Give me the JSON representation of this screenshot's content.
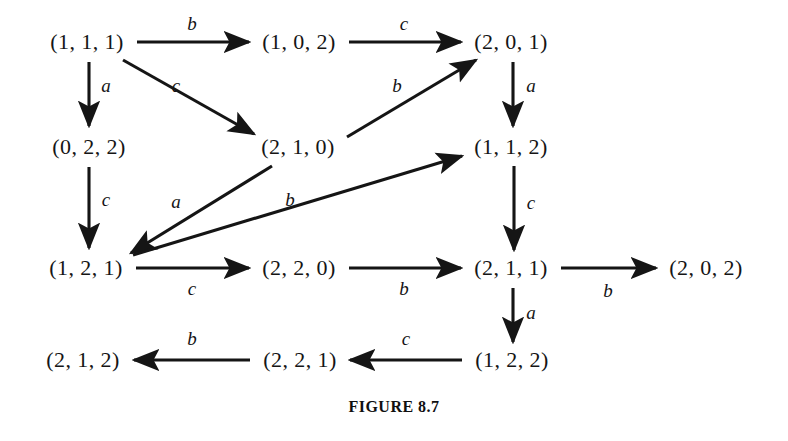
{
  "figure": {
    "caption": "FIGURE 8.7",
    "background_color": "#ffffff",
    "ink_color": "#151515",
    "width": 788,
    "height": 441
  },
  "graph_data": {
    "type": "directed-graph",
    "alphabet": [
      "a",
      "b",
      "c"
    ],
    "nodes": [
      {
        "id": "n111",
        "label": "(1, 1, 1)",
        "x": 87,
        "y": 42
      },
      {
        "id": "n102",
        "label": "(1, 0, 2)",
        "x": 299,
        "y": 42
      },
      {
        "id": "n201",
        "label": "(2, 0, 1)",
        "x": 511,
        "y": 42
      },
      {
        "id": "n022",
        "label": "(0, 2, 2)",
        "x": 89,
        "y": 147
      },
      {
        "id": "n210",
        "label": "(2, 1, 0)",
        "x": 298,
        "y": 147
      },
      {
        "id": "n112",
        "label": "(1, 1, 2)",
        "x": 511,
        "y": 147
      },
      {
        "id": "n121",
        "label": "(1, 2, 1)",
        "x": 86,
        "y": 268
      },
      {
        "id": "n220",
        "label": "(2, 2, 0)",
        "x": 299,
        "y": 268
      },
      {
        "id": "n211",
        "label": "(2, 1, 1)",
        "x": 511,
        "y": 268
      },
      {
        "id": "n202",
        "label": "(2, 0, 2)",
        "x": 706,
        "y": 268
      },
      {
        "id": "n212",
        "label": "(2, 1, 2)",
        "x": 83,
        "y": 360
      },
      {
        "id": "n221",
        "label": "(2, 2, 1)",
        "x": 300,
        "y": 360
      },
      {
        "id": "n122",
        "label": "(1, 2, 2)",
        "x": 512,
        "y": 360
      }
    ],
    "edges": [
      {
        "from": "n111",
        "to": "n102",
        "label": "b",
        "x1": 137,
        "y1": 42,
        "x2": 249,
        "y2": 42,
        "lx": 192,
        "ly": 24
      },
      {
        "from": "n102",
        "to": "n201",
        "label": "c",
        "x1": 349,
        "y1": 42,
        "x2": 461,
        "y2": 42,
        "lx": 404,
        "ly": 24
      },
      {
        "from": "n111",
        "to": "n022",
        "label": "a",
        "x1": 89,
        "y1": 62,
        "x2": 89,
        "y2": 126,
        "lx": 106,
        "ly": 86
      },
      {
        "from": "n111",
        "to": "n210",
        "label": "c",
        "x1": 123,
        "y1": 60,
        "x2": 254,
        "y2": 134,
        "lx": 176,
        "ly": 86
      },
      {
        "from": "n022",
        "to": "n121",
        "label": "c",
        "x1": 89,
        "y1": 167,
        "x2": 89,
        "y2": 248,
        "lx": 106,
        "ly": 200
      },
      {
        "from": "n210",
        "to": "n201",
        "label": "b",
        "x1": 347,
        "y1": 137,
        "x2": 476,
        "y2": 60,
        "lx": 397,
        "ly": 86
      },
      {
        "from": "n201",
        "to": "n112",
        "label": "a",
        "x1": 513,
        "y1": 62,
        "x2": 513,
        "y2": 126,
        "lx": 531,
        "ly": 86
      },
      {
        "from": "n210",
        "to": "n121",
        "label": "a",
        "x1": 272,
        "y1": 166,
        "x2": 131,
        "y2": 253,
        "lx": 176,
        "ly": 202
      },
      {
        "from": "n121",
        "to": "n112",
        "label": "b",
        "x1": 133,
        "y1": 255,
        "x2": 462,
        "y2": 156,
        "lx": 290,
        "ly": 200
      },
      {
        "from": "n112",
        "to": "n211",
        "label": "c",
        "x1": 514,
        "y1": 166,
        "x2": 514,
        "y2": 250,
        "lx": 531,
        "ly": 203
      },
      {
        "from": "n121",
        "to": "n220",
        "label": "c",
        "x1": 136,
        "y1": 268,
        "x2": 249,
        "y2": 268,
        "lx": 192,
        "ly": 289
      },
      {
        "from": "n220",
        "to": "n211",
        "label": "b",
        "x1": 349,
        "y1": 268,
        "x2": 461,
        "y2": 268,
        "lx": 404,
        "ly": 289
      },
      {
        "from": "n211",
        "to": "n202",
        "label": "b",
        "x1": 561,
        "y1": 268,
        "x2": 656,
        "y2": 268,
        "lx": 608,
        "ly": 291
      },
      {
        "from": "n211",
        "to": "n122",
        "label": "a",
        "x1": 513,
        "y1": 288,
        "x2": 513,
        "y2": 342,
        "lx": 531,
        "ly": 313
      },
      {
        "from": "n122",
        "to": "n221",
        "label": "c",
        "x1": 462,
        "y1": 360,
        "x2": 350,
        "y2": 360,
        "lx": 406,
        "ly": 339
      },
      {
        "from": "n221",
        "to": "n212",
        "label": "b",
        "x1": 250,
        "y1": 360,
        "x2": 134,
        "y2": 360,
        "lx": 192,
        "ly": 339
      }
    ]
  }
}
